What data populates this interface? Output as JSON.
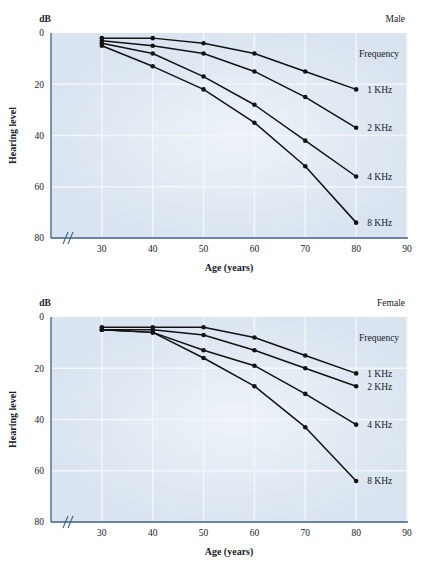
{
  "colors": {
    "plot_background": "#d9e4f0",
    "gridline": "#f2f7fb",
    "axis_line": "#3f5f85",
    "series_line": "#121212",
    "marker": "#121212",
    "text": "#15202b",
    "page_background": "#ffffff"
  },
  "chart_data": [
    {
      "type": "line",
      "title": "Male",
      "xlabel": "Age (years)",
      "ylabel": "Hearing level",
      "yunit": "dB",
      "x": [
        30,
        40,
        50,
        60,
        70,
        80
      ],
      "xticks": [
        30,
        40,
        50,
        60,
        70,
        80,
        90
      ],
      "yticks": [
        0,
        20,
        40,
        60,
        80
      ],
      "xlim": [
        30,
        90
      ],
      "ylim": [
        0,
        80
      ],
      "y_inverted": true,
      "axis_break": true,
      "grid": true,
      "legend_title": "Frequency",
      "legend_position": "right",
      "series": [
        {
          "name": "1 KHz",
          "values": [
            2,
            2,
            4,
            8,
            15,
            22
          ]
        },
        {
          "name": "2 KHz",
          "values": [
            3,
            5,
            8,
            15,
            25,
            37
          ]
        },
        {
          "name": "4 KHz",
          "values": [
            4,
            8,
            17,
            28,
            42,
            56
          ]
        },
        {
          "name": "8 KHz",
          "values": [
            5,
            13,
            22,
            35,
            52,
            74
          ]
        }
      ]
    },
    {
      "type": "line",
      "title": "Female",
      "xlabel": "Age (years)",
      "ylabel": "Hearing level",
      "yunit": "dB",
      "x": [
        30,
        40,
        50,
        60,
        70,
        80
      ],
      "xticks": [
        30,
        40,
        50,
        60,
        70,
        80,
        90
      ],
      "yticks": [
        0,
        20,
        40,
        60,
        80
      ],
      "xlim": [
        30,
        90
      ],
      "ylim": [
        0,
        80
      ],
      "y_inverted": true,
      "axis_break": true,
      "grid": true,
      "legend_title": "Frequency",
      "legend_position": "right",
      "series": [
        {
          "name": "1 KHz",
          "values": [
            4,
            4,
            4,
            8,
            15,
            22
          ]
        },
        {
          "name": "2 KHz",
          "values": [
            5,
            5,
            7,
            13,
            20,
            27
          ]
        },
        {
          "name": "4 KHz",
          "values": [
            5,
            6,
            13,
            19,
            30,
            42
          ]
        },
        {
          "name": "8 KHz",
          "values": [
            5,
            6,
            16,
            27,
            43,
            64
          ]
        }
      ]
    }
  ],
  "panels": [
    {
      "id": "male",
      "title": "Male",
      "yunit": "dB",
      "ylabel": "Hearing level",
      "xlabel": "Age (years)",
      "legend_title": "Frequency"
    },
    {
      "id": "female",
      "title": "Female",
      "yunit": "dB",
      "ylabel": "Hearing level",
      "xlabel": "Age (years)",
      "legend_title": "Frequency"
    }
  ]
}
